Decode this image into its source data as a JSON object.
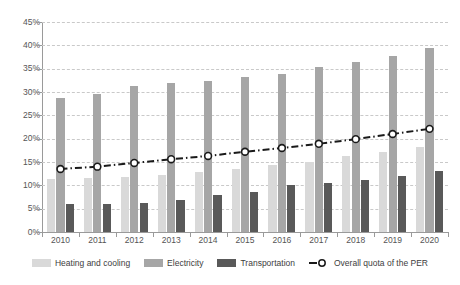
{
  "chart_data": {
    "type": "bar",
    "title": "",
    "subtitle": "",
    "xlabel": "",
    "ylabel": "",
    "categories": [
      "2010",
      "2011",
      "2012",
      "2013",
      "2014",
      "2015",
      "2016",
      "2017",
      "2018",
      "2019",
      "2020"
    ],
    "ylim": [
      0,
      45
    ],
    "ytick_labels": [
      "0%",
      "5%",
      "10%",
      "15%",
      "20%",
      "25%",
      "30%",
      "35%",
      "40%",
      "45%"
    ],
    "ytick_values": [
      0,
      5,
      10,
      15,
      20,
      25,
      30,
      35,
      40,
      45
    ],
    "grid": true,
    "legend_position": "bottom",
    "series": [
      {
        "name": "Heating and cooling",
        "type": "bar",
        "color": "#d9d9d9",
        "values": [
          11.3,
          11.6,
          11.8,
          12.2,
          12.9,
          13.6,
          14.3,
          15.1,
          16.2,
          17.2,
          18.3
        ]
      },
      {
        "name": "Electricity",
        "type": "bar",
        "color": "#a6a6a6",
        "values": [
          28.7,
          29.6,
          31.2,
          31.9,
          32.3,
          33.2,
          33.9,
          35.3,
          36.5,
          37.8,
          39.4
        ]
      },
      {
        "name": "Transportation",
        "type": "bar",
        "color": "#595959",
        "values": [
          5.9,
          6.0,
          6.3,
          6.8,
          8.0,
          8.6,
          10.0,
          10.5,
          11.2,
          12.0,
          13.1
        ]
      },
      {
        "name": "Overall quota of the PER",
        "type": "line",
        "color": "#1a1a1a",
        "marker": "circle-open",
        "values": [
          13.5,
          14.0,
          14.8,
          15.6,
          16.3,
          17.2,
          18.0,
          18.9,
          19.9,
          21.0,
          22.1
        ]
      }
    ]
  },
  "legend": {
    "items": [
      {
        "label": "Heating and cooling",
        "kind": "swatch",
        "swatch_class": "heating"
      },
      {
        "label": "Electricity",
        "kind": "swatch",
        "swatch_class": "electricity"
      },
      {
        "label": "Transportation",
        "kind": "swatch",
        "swatch_class": "transportation"
      },
      {
        "label": "Overall quota of the PER",
        "kind": "line-marker",
        "swatch_class": "per"
      }
    ]
  },
  "colors": {
    "heating": "#d9d9d9",
    "electricity": "#a6a6a6",
    "transportation": "#595959",
    "per_line": "#1a1a1a",
    "gridline": "#c9c9c9",
    "axis": "#9a9a9a",
    "text": "#555555",
    "background": "#ffffff"
  }
}
